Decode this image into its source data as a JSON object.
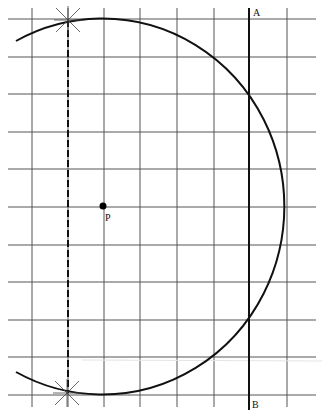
{
  "diagram": {
    "type": "geometric construction on grid",
    "grid": {
      "vertical_x": [
        32,
        68,
        104,
        140,
        177,
        214,
        287
      ],
      "horizontal_y": [
        19,
        57,
        94,
        132,
        169,
        207,
        245,
        282,
        320,
        357,
        395
      ],
      "x_range": [
        8,
        316
      ],
      "y_range": [
        8,
        407
      ],
      "color": "#555555"
    },
    "center_point": {
      "label": "P",
      "x": 103,
      "y": 206
    },
    "arc": {
      "cx": 103,
      "cy": 206,
      "rx": 182,
      "ry": 188,
      "start": [
        16,
        41
      ],
      "end": [
        16,
        372
      ],
      "color": "#111111"
    },
    "line_AB": {
      "x": 249,
      "y1": 8,
      "y2": 410,
      "label_top": "A",
      "label_bottom": "B"
    },
    "dashed_chord": {
      "x": 68,
      "y1": 20,
      "y2": 393
    },
    "intersection_marks": [
      {
        "x": 68,
        "y": 20
      },
      {
        "x": 67,
        "y": 393
      }
    ]
  },
  "labels": {
    "p": "P",
    "a": "A",
    "b": "B"
  }
}
